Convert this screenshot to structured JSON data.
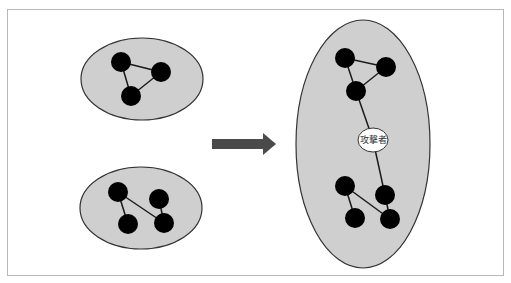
{
  "diagram": {
    "type": "network-merge",
    "colors": {
      "cluster_fill": "#cfcfcf",
      "cluster_stroke": "#333333",
      "node_fill": "#000000",
      "edge": "#1a1a1a",
      "arrow": "#4a4a4a",
      "attacker_fill": "#ffffff"
    },
    "left_top_cluster": {
      "nodes": [
        "a",
        "b",
        "c"
      ],
      "edges": [
        [
          "a",
          "b"
        ],
        [
          "a",
          "c"
        ],
        [
          "b",
          "c"
        ]
      ]
    },
    "left_bottom_cluster": {
      "nodes": [
        "d",
        "e",
        "f",
        "g"
      ],
      "edges": [
        [
          "d",
          "f"
        ],
        [
          "d",
          "g"
        ],
        [
          "e",
          "g"
        ]
      ]
    },
    "arrow": {
      "direction": "right"
    },
    "merged_cluster": {
      "attacker_label": "攻撃者",
      "edges_note": "attacker node bridges the two groups"
    }
  }
}
